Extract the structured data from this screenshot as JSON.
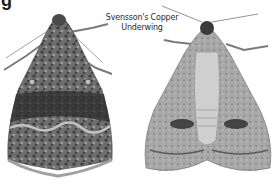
{
  "figure": {
    "corner_text": "g",
    "caption": {
      "line1": "Svensson's Copper",
      "line2": "Underwing"
    }
  },
  "specimens": [
    {
      "view": "upperside",
      "tone": "dark mottled grey"
    },
    {
      "view": "underside",
      "tone": "pale grey with dark bands"
    }
  ],
  "colors": {
    "background": "#ffffff",
    "text": "#2a2a2a",
    "moth_dark": "#3a3a3a",
    "moth_mid": "#7a7a7a",
    "moth_light": "#b5b5b5"
  }
}
